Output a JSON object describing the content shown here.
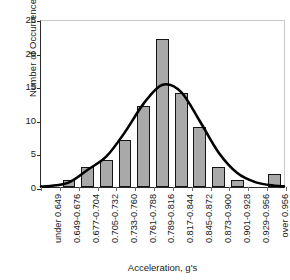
{
  "chart_data": {
    "type": "bar",
    "title": "",
    "subtitle": "",
    "xlabel": "Acceleration, g's",
    "ylabel": "Number of Occurrences",
    "categories": [
      "under 0.649",
      "0.649-0.676",
      "0.677-0.704",
      "0.705-0.732",
      "0.733-0.760",
      "0.761-0.788",
      "0.789-0.816",
      "0.817-0.844",
      "0.845-0.872",
      "0.873-0.900",
      "0.901-0.928",
      "0.929-0.956",
      "over 0.956"
    ],
    "values": [
      0,
      1,
      3,
      4,
      7,
      12,
      22,
      14,
      9,
      3,
      1,
      0,
      2
    ],
    "ylim": [
      0,
      25
    ],
    "yticks": [
      0,
      5,
      10,
      15,
      20,
      25
    ],
    "ytick_labels": [
      "0",
      "5",
      "10",
      "15",
      "20",
      "25"
    ],
    "grid": false,
    "legend": false,
    "legend_position": "none",
    "overlay": {
      "name": "normal-fit-curve",
      "type": "line",
      "peak_value": 15.5,
      "peak_category": "0.789-0.816",
      "values": [
        0.15,
        0.7,
        2.6,
        4.6,
        8.3,
        12.6,
        15.4,
        14.3,
        9.9,
        5.2,
        2.1,
        0.7,
        0.2
      ]
    },
    "colors": {
      "bar_fill": "#a9a9a9",
      "bar_border": "#141414",
      "curve": "#000000",
      "axis": "#2b2b2b",
      "frame": "#c9c9c9",
      "text": "#1a1a1a",
      "background": "#ffffff"
    }
  }
}
